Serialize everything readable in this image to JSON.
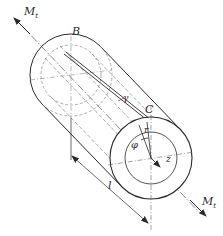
{
  "diagram": {
    "colors": {
      "stroke": "#2a2a2a",
      "dashed": "#8a8a8a",
      "background": "#ffffff"
    },
    "labels": {
      "torque_top": "M",
      "torque_top_sub": "t",
      "torque_bottom": "M",
      "torque_bottom_sub": "t",
      "point_b": "B",
      "point_c": "C",
      "shear_angle": "γ",
      "twist_angle": "φ",
      "radius": "r",
      "axis": "z",
      "length": "l"
    }
  }
}
